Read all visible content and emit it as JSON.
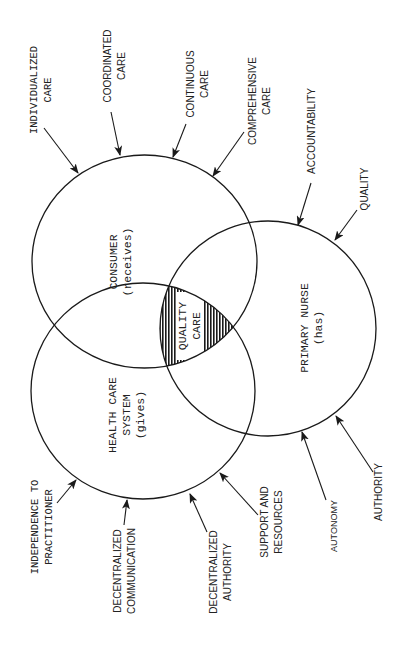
{
  "diagram": {
    "type": "venn",
    "orientation": "rotated-90-ccw",
    "circles": [
      {
        "id": "consumer",
        "title": "CONSUMER",
        "subtitle": "(receives)"
      },
      {
        "id": "health_care_system",
        "title": "HEALTH CARE",
        "title2": "SYSTEM",
        "subtitle": "(gives)"
      },
      {
        "id": "primary_nurse",
        "title": "PRIMARY NURSE",
        "subtitle": "(has)"
      }
    ],
    "intersection": {
      "line1": "QUALITY",
      "line2": "CARE"
    },
    "consumer_inputs": [
      {
        "line1": "INDIVIDUALIZED",
        "line2": "CARE"
      },
      {
        "line1": "COORDINATED",
        "line2": "CARE"
      },
      {
        "line1": "CONTINUOUS",
        "line2": "CARE"
      },
      {
        "line1": "COMPREHENSIVE",
        "line2": "CARE"
      }
    ],
    "nurse_inputs": [
      {
        "line1": "ACCOUNTABILITY"
      },
      {
        "line1": "QUALITY"
      },
      {
        "line1": "AUTONOMY"
      },
      {
        "line1": "AUTHORITY"
      }
    ],
    "system_inputs": [
      {
        "line1": "INDEPENDENCE TO",
        "line2": "PRACTITIONER"
      },
      {
        "line1": "DECENTRALIZED",
        "line2": "COMMUNICATION"
      },
      {
        "line1": "DECENTRALIZED",
        "line2": "AUTHORITY"
      },
      {
        "line1": "SUPPORT AND",
        "line2": "RESOURCES"
      }
    ]
  },
  "colors": {
    "ink": "#1a1a1a",
    "background": "#ffffff"
  }
}
